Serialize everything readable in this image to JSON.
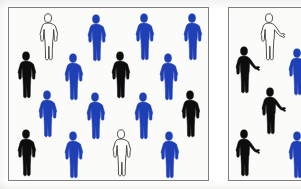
{
  "image": {
    "title": "Two bounded groups of human pictograms",
    "description": "Left panel: dense 4x4 arrangement of standing human figures. Right panel: sparser arrangement of gesturing human figures with one arm extended.",
    "background_color": "#ffffff",
    "panel_fill": "#fbfbf9",
    "panel_border_color": "#7d7f80"
  },
  "palette": {
    "blue": "#1f3fb5",
    "black": "#0d0d0d",
    "white_fill": "#fdfdfb",
    "white_outline": "#3c3c3c"
  },
  "legend": {
    "blue_label": "blue figure",
    "black_label": "black figure",
    "white_label": "white outline figure"
  },
  "panels": [
    {
      "id": "left-panel",
      "name": "left-panel",
      "x": 8,
      "y": 7,
      "width": 201,
      "height": 174,
      "pose": "arms-at-sides",
      "counts": {
        "blue": 9,
        "black": 5,
        "white": 2,
        "total": 16
      },
      "rows": [
        {
          "row_index": 1,
          "figures": [
            {
              "color": "white",
              "x": 26,
              "y": 5,
              "scale": 1.0
            },
            {
              "color": "blue",
              "x": 74,
              "y": 6,
              "scale": 1.0
            },
            {
              "color": "blue",
              "x": 122,
              "y": 5,
              "scale": 1.0
            },
            {
              "color": "blue",
              "x": 170,
              "y": 5,
              "scale": 1.0
            }
          ]
        },
        {
          "row_index": 2,
          "figures": [
            {
              "color": "black",
              "x": 4,
              "y": 43,
              "scale": 1.0
            },
            {
              "color": "blue",
              "x": 51,
              "y": 45,
              "scale": 1.0
            },
            {
              "color": "black",
              "x": 98,
              "y": 43,
              "scale": 1.0
            },
            {
              "color": "blue",
              "x": 146,
              "y": 45,
              "scale": 1.0
            }
          ]
        },
        {
          "row_index": 3,
          "figures": [
            {
              "color": "blue",
              "x": 25,
              "y": 82,
              "scale": 1.0
            },
            {
              "color": "blue",
              "x": 73,
              "y": 84,
              "scale": 1.0
            },
            {
              "color": "blue",
              "x": 121,
              "y": 84,
              "scale": 1.0
            },
            {
              "color": "black",
              "x": 168,
              "y": 82,
              "scale": 1.0
            }
          ]
        },
        {
          "row_index": 4,
          "figures": [
            {
              "color": "black",
              "x": 4,
              "y": 121,
              "scale": 1.0
            },
            {
              "color": "blue",
              "x": 51,
              "y": 123,
              "scale": 1.0
            },
            {
              "color": "white",
              "x": 99,
              "y": 121,
              "scale": 1.0
            },
            {
              "color": "blue",
              "x": 147,
              "y": 123,
              "scale": 1.0
            }
          ]
        }
      ]
    },
    {
      "id": "right-panel",
      "name": "right-panel",
      "x": 228,
      "y": 7,
      "width": 86,
      "height": 174,
      "pose": "one-arm-extended",
      "counts": {
        "blue": 2,
        "black": 3,
        "white": 1,
        "total": 6
      },
      "rows": [
        {
          "row_index": 1,
          "figures": [
            {
              "color": "white",
              "x": 28,
              "y": 5,
              "scale": 1.0
            }
          ]
        },
        {
          "row_index": 2,
          "figures": [
            {
              "color": "black",
              "x": 3,
              "y": 38,
              "scale": 1.0
            },
            {
              "color": "blue",
              "x": 56,
              "y": 40,
              "scale": 1.0
            }
          ]
        },
        {
          "row_index": 3,
          "figures": [
            {
              "color": "black",
              "x": 29,
              "y": 79,
              "scale": 1.0
            }
          ]
        },
        {
          "row_index": 4,
          "figures": [
            {
              "color": "black",
              "x": 3,
              "y": 121,
              "scale": 1.0
            },
            {
              "color": "blue",
              "x": 56,
              "y": 123,
              "scale": 1.0
            }
          ]
        }
      ]
    }
  ]
}
